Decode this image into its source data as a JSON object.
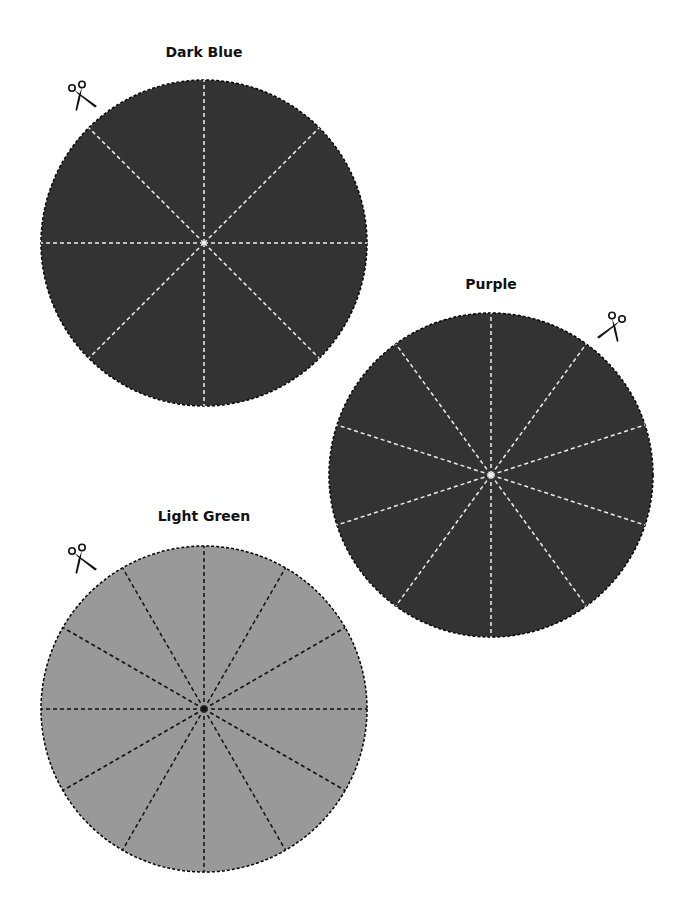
{
  "circles": [
    {
      "label": "Dark Blue",
      "cx": 204,
      "cy": 243,
      "r": 163,
      "fill": "#333333",
      "line_color": "#eeeeee",
      "spokes": 8,
      "start_angle": 0,
      "label_x": 204,
      "label_y": 52,
      "scissors_x": 66,
      "scissors_y": 80,
      "scissors_flip": false
    },
    {
      "label": "Purple",
      "cx": 491,
      "cy": 475,
      "r": 162,
      "fill": "#333333",
      "line_color": "#eeeeee",
      "spokes": 10,
      "start_angle": 0,
      "label_x": 491,
      "label_y": 284,
      "scissors_x": 594,
      "scissors_y": 311,
      "scissors_flip": true
    },
    {
      "label": "Light Green",
      "cx": 204,
      "cy": 709,
      "r": 163,
      "fill": "#999999",
      "line_color": "#111111",
      "spokes": 12,
      "start_angle": 0,
      "label_x": 204,
      "label_y": 516,
      "scissors_x": 66,
      "scissors_y": 543,
      "scissors_flip": false
    }
  ],
  "icons": {
    "cut": "scissors-icon"
  }
}
